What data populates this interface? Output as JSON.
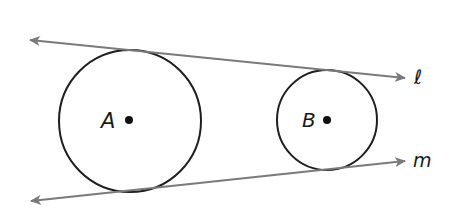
{
  "diagram": {
    "type": "two circles with common external tangent lines",
    "colors": {
      "background": "#ffffff",
      "circle_stroke": "#1e1e1e",
      "line_stroke": "#7a7a7a",
      "point_fill": "#111111",
      "label": "#1a1a1a"
    },
    "circles": [
      {
        "name": "A",
        "label": "A",
        "center": [
          130,
          121
        ],
        "radius": 71
      },
      {
        "name": "B",
        "label": "B",
        "center": [
          327,
          120
        ],
        "radius": 50
      }
    ],
    "lines": [
      {
        "name": "l",
        "label": "ℓ",
        "start": [
          28,
          40
        ],
        "end": [
          407,
          78
        ],
        "arrows": "both"
      },
      {
        "name": "m",
        "label": "m",
        "start": [
          29,
          201
        ],
        "end": [
          407,
          161
        ],
        "arrows": "both"
      }
    ]
  }
}
